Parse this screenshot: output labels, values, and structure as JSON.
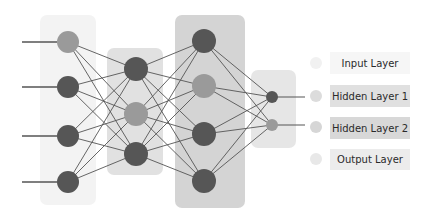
{
  "diagram": {
    "type": "neural-network",
    "colors": {
      "node_dark": "#565656",
      "node_medium": "#9a9a9a",
      "edge": "#555555",
      "legend_dot": "#dcdcdc"
    },
    "layers": [
      {
        "id": "input",
        "name": "Input Layer",
        "panel_fill": "#f3f3f3",
        "node_count": 4,
        "node_shades": [
          "medium",
          "dark",
          "dark",
          "dark"
        ]
      },
      {
        "id": "hidden1",
        "name": "Hidden Layer 1",
        "panel_fill": "#e1e1e1",
        "node_count": 3,
        "node_shades": [
          "dark",
          "medium",
          "dark"
        ]
      },
      {
        "id": "hidden2",
        "name": "Hidden Layer 2",
        "panel_fill": "#d4d4d4",
        "node_count": 4,
        "node_shades": [
          "dark",
          "medium",
          "dark",
          "dark"
        ]
      },
      {
        "id": "output",
        "name": "Output Layer",
        "panel_fill": "#e6e6e6",
        "node_count": 2,
        "node_shades": [
          "dark",
          "medium"
        ]
      }
    ],
    "connections": "fully-connected between adjacent layers"
  },
  "legend": {
    "items": [
      {
        "label": "Input Layer",
        "box_fill": "#f6f6f6"
      },
      {
        "label": "Hidden Layer 1",
        "box_fill": "#e0e0e0"
      },
      {
        "label": "Hidden Layer 2",
        "box_fill": "#d8d8d8"
      },
      {
        "label": "Output Layer",
        "box_fill": "#ececec"
      }
    ]
  }
}
